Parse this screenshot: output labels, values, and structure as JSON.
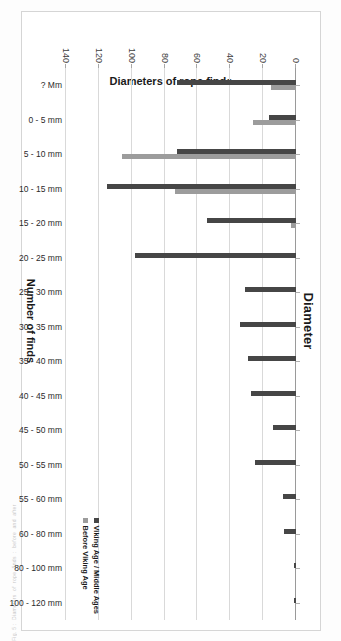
{
  "page": {
    "margin_text": "Fig. 5 :  Diameters  of  rope  finds  :  before  and  after"
  },
  "chart_data": {
    "type": "bar",
    "title": "Diameters of rope finds",
    "xlabel": "Diameter",
    "ylabel": "Number of finds",
    "ylim": [
      0,
      140
    ],
    "yticks": [
      0,
      20,
      40,
      60,
      80,
      100,
      120,
      140
    ],
    "grid": true,
    "legend_position": "inside-bottom-right",
    "categories": [
      "? Mm",
      "0 - 5 mm",
      "5 - 10 mm",
      "10 - 15 mm",
      "15 - 20 mm",
      "20 - 25 mm",
      "25 - 30 mm",
      "30 - 35 mm",
      "35 - 40 mm",
      "40 - 45 mm",
      "45 - 50 mm",
      "50 - 55 mm",
      "55 - 60 mm",
      "60 - 80 mm",
      "80 - 100 mm",
      "100 - 120 mm"
    ],
    "series": [
      {
        "name": "Viking Age / Middle Ages",
        "color": "#464646",
        "values": [
          72,
          16,
          72,
          114,
          54,
          97,
          31,
          34,
          29,
          27,
          14,
          25,
          8,
          7,
          1.5,
          1.5
        ]
      },
      {
        "name": "Before Viking Age",
        "color": "#9c9c9c",
        "values": [
          15,
          26,
          105,
          73,
          3,
          0,
          0,
          0,
          0,
          0,
          0,
          0,
          0,
          0,
          0,
          0
        ]
      }
    ]
  }
}
